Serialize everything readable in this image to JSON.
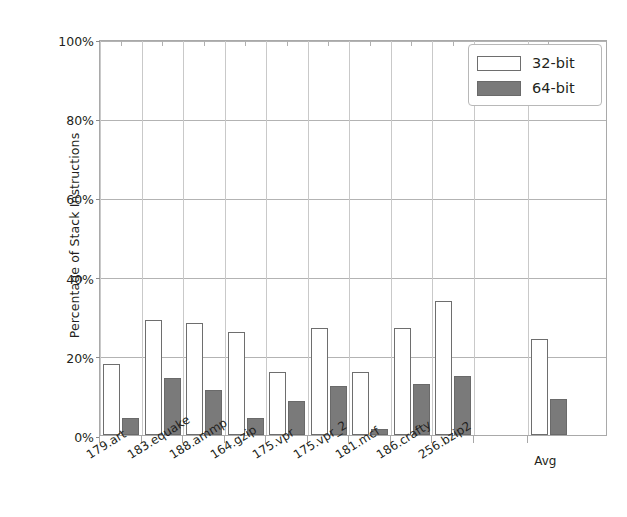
{
  "chart_data": {
    "type": "bar",
    "title": "",
    "xlabel": "",
    "ylabel": "Percentage of Stack Instructions",
    "ylim": [
      0,
      100
    ],
    "yticks": [
      "0%",
      "20%",
      "40%",
      "60%",
      "80%",
      "100%"
    ],
    "ytick_values": [
      0,
      20,
      40,
      60,
      80,
      100
    ],
    "grid": "horizontal",
    "legend_position": "top-right",
    "categories": [
      "179.art",
      "183.equake",
      "188.ammp",
      "164.gzip",
      "175.vpr",
      "175.vpr_2",
      "181.mcf",
      "186.crafty",
      "256.bzip2",
      "Avg"
    ],
    "series": [
      {
        "name": "32-bit",
        "color": "#ffffff",
        "values": [
          18.0,
          29.0,
          28.3,
          26.0,
          16.0,
          27.0,
          16.0,
          27.0,
          33.8,
          24.2
        ]
      },
      {
        "name": "64-bit",
        "color": "#7a7a7a",
        "values": [
          4.2,
          14.3,
          11.4,
          4.3,
          8.7,
          12.3,
          1.4,
          13.0,
          14.8,
          9.1
        ]
      }
    ]
  },
  "legend": {
    "entries": [
      {
        "label": "32-bit",
        "swatch": "hollow-white-rect"
      },
      {
        "label": "64-bit",
        "swatch": "filled-gray-rect"
      }
    ]
  },
  "axes": {
    "y_title": "Percentage of Stack Instructions",
    "y_tick_labels": [
      "100%",
      "80%",
      "60%",
      "40%",
      "20%",
      "0%"
    ]
  }
}
